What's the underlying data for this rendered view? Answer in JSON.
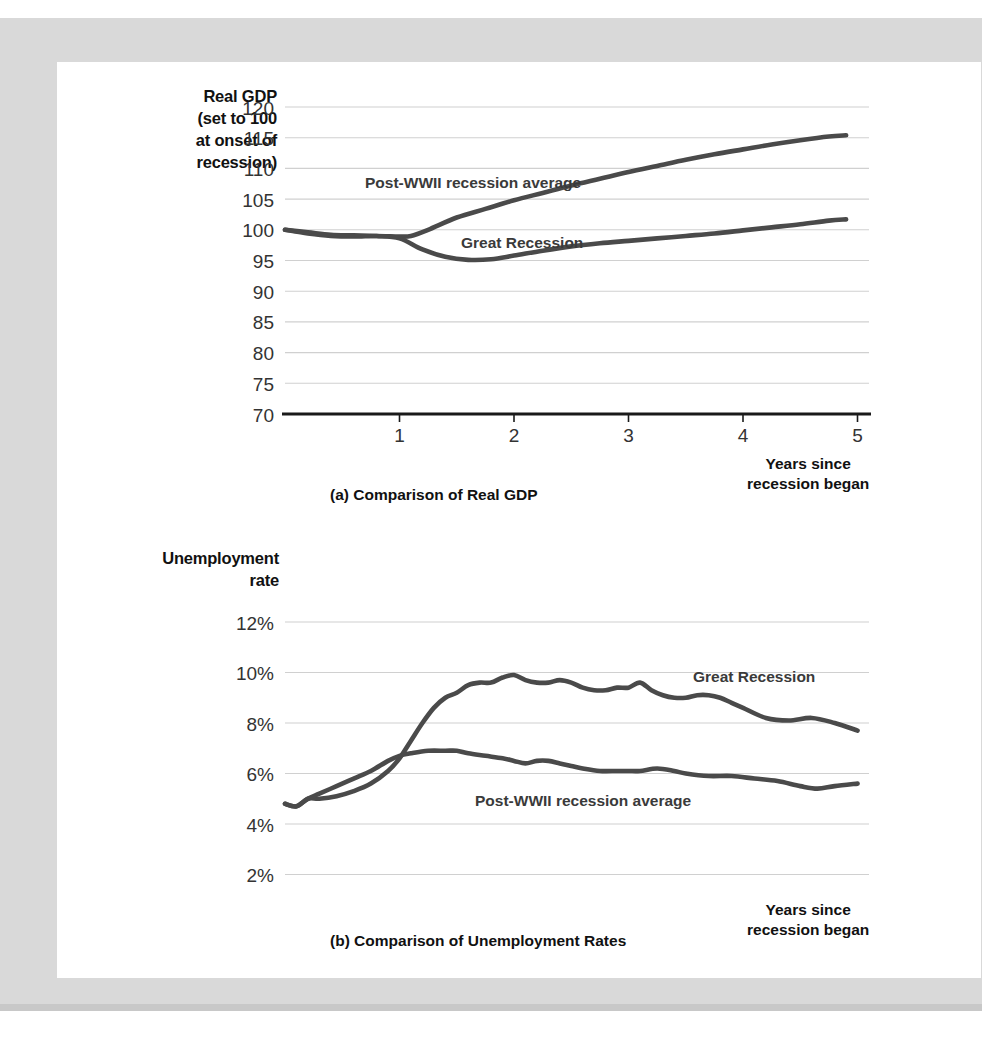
{
  "figures": [
    {
      "id": "a",
      "caption": "(a) Comparison of Real GDP",
      "axis_title": "Real GDP (set to 100 at onset of recession)",
      "axis_title_lines": [
        "Real GDP",
        "(set to 100",
        "at onset of",
        "recession)"
      ],
      "x_axis_label_lines": [
        "Years since",
        "recession began"
      ],
      "series_labels": {
        "postwwii": "Post-WWII recession average",
        "great": "Great Recession"
      }
    },
    {
      "id": "b",
      "caption": "(b) Comparison of Unemployment Rates",
      "axis_title": "Unemployment rate",
      "axis_title_lines": [
        "Unemployment",
        "rate"
      ],
      "x_axis_label_lines": [
        "Years since",
        "recession began"
      ],
      "series_labels": {
        "postwwii": "Post-WWII recession average",
        "great": "Great Recession"
      }
    }
  ],
  "colors": {
    "line": "#4a4a4a",
    "axis": "#1a1a1a",
    "grid": "#d0d0d0",
    "tick_text": "#333333",
    "mat": "#d9d9d9",
    "card": "#ffffff"
  },
  "chart_data": [
    {
      "type": "line",
      "title": "(a) Comparison of Real GDP",
      "xlabel": "Years since recession began",
      "ylabel": "Real GDP (set to 100 at onset of recession)",
      "xlim": [
        0,
        5.1
      ],
      "ylim": [
        70,
        120
      ],
      "xticks": [
        1,
        2,
        3,
        4,
        5
      ],
      "xtick_labels": [
        "1",
        "2",
        "3",
        "4",
        "5"
      ],
      "yticks": [
        70,
        75,
        80,
        85,
        90,
        95,
        100,
        105,
        110,
        115,
        120
      ],
      "ytick_labels": [
        "70",
        "75",
        "80",
        "85",
        "90",
        "95",
        "100",
        "105",
        "110",
        "115",
        "120"
      ],
      "grid": true,
      "legend": "inline-annotation",
      "series": [
        {
          "name": "Post-WWII recession average",
          "x": [
            0,
            0.2,
            0.4,
            0.6,
            0.8,
            1.0,
            1.1,
            1.25,
            1.5,
            1.75,
            2.0,
            2.25,
            2.5,
            2.75,
            3.0,
            3.25,
            3.5,
            3.75,
            4.0,
            4.25,
            4.5,
            4.75,
            4.9
          ],
          "values": [
            100.0,
            99.4,
            99.0,
            98.9,
            99.0,
            98.9,
            99.0,
            100.0,
            102.0,
            103.4,
            104.8,
            106.0,
            107.2,
            108.3,
            109.4,
            110.4,
            111.4,
            112.3,
            113.1,
            113.9,
            114.6,
            115.2,
            115.4
          ]
        },
        {
          "name": "Great Recession",
          "x": [
            0,
            0.2,
            0.4,
            0.6,
            0.8,
            1.0,
            1.2,
            1.4,
            1.6,
            1.8,
            2.0,
            2.25,
            2.5,
            2.75,
            3.0,
            3.25,
            3.5,
            3.75,
            4.0,
            4.25,
            4.5,
            4.75,
            4.9
          ],
          "values": [
            100.0,
            99.6,
            99.2,
            99.1,
            99.0,
            98.6,
            96.8,
            95.6,
            95.1,
            95.2,
            95.8,
            96.6,
            97.3,
            97.8,
            98.2,
            98.6,
            99.0,
            99.4,
            99.9,
            100.4,
            100.9,
            101.5,
            101.7
          ]
        }
      ]
    },
    {
      "type": "line",
      "title": "(b) Comparison of Unemployment Rates",
      "xlabel": "Years since recession began",
      "ylabel": "Unemployment rate",
      "xlim": [
        0,
        5.1
      ],
      "ylim": [
        0,
        12
      ],
      "xticks": [
        1,
        2,
        3,
        4,
        5
      ],
      "xtick_labels": [
        "1",
        "2",
        "3",
        "4",
        "5"
      ],
      "yticks": [
        0,
        2,
        4,
        6,
        8,
        10,
        12
      ],
      "ytick_labels": [
        "0%",
        "2%",
        "4%",
        "6%",
        "8%",
        "10%",
        "12%"
      ],
      "grid": true,
      "legend": "inline-annotation",
      "series": [
        {
          "name": "Great Recession",
          "x": [
            0,
            0.1,
            0.2,
            0.3,
            0.45,
            0.6,
            0.75,
            0.9,
            1.0,
            1.1,
            1.2,
            1.3,
            1.4,
            1.5,
            1.6,
            1.7,
            1.8,
            1.9,
            2.0,
            2.1,
            2.2,
            2.3,
            2.4,
            2.5,
            2.6,
            2.7,
            2.8,
            2.9,
            3.0,
            3.1,
            3.2,
            3.3,
            3.4,
            3.5,
            3.6,
            3.7,
            3.8,
            3.9,
            4.0,
            4.2,
            4.4,
            4.6,
            4.8,
            5.0
          ],
          "values": [
            4.8,
            4.7,
            5.0,
            5.0,
            5.1,
            5.3,
            5.6,
            6.1,
            6.6,
            7.3,
            8.0,
            8.6,
            9.0,
            9.2,
            9.5,
            9.6,
            9.6,
            9.8,
            9.9,
            9.7,
            9.6,
            9.6,
            9.7,
            9.6,
            9.4,
            9.3,
            9.3,
            9.4,
            9.4,
            9.6,
            9.3,
            9.1,
            9.0,
            9.0,
            9.1,
            9.1,
            9.0,
            8.8,
            8.6,
            8.2,
            8.1,
            8.2,
            8.0,
            7.7
          ]
        },
        {
          "name": "Post-WWII recession average",
          "x": [
            0,
            0.1,
            0.2,
            0.3,
            0.45,
            0.6,
            0.75,
            0.9,
            1.0,
            1.1,
            1.25,
            1.4,
            1.5,
            1.6,
            1.75,
            1.9,
            2.0,
            2.1,
            2.2,
            2.3,
            2.4,
            2.5,
            2.6,
            2.75,
            2.9,
            3.0,
            3.1,
            3.25,
            3.4,
            3.5,
            3.7,
            3.9,
            4.1,
            4.3,
            4.5,
            4.65,
            4.8,
            5.0
          ],
          "values": [
            4.8,
            4.7,
            5.0,
            5.2,
            5.5,
            5.8,
            6.1,
            6.5,
            6.7,
            6.8,
            6.9,
            6.9,
            6.9,
            6.8,
            6.7,
            6.6,
            6.5,
            6.4,
            6.5,
            6.5,
            6.4,
            6.3,
            6.2,
            6.1,
            6.1,
            6.1,
            6.1,
            6.2,
            6.1,
            6.0,
            5.9,
            5.9,
            5.8,
            5.7,
            5.5,
            5.4,
            5.5,
            5.6
          ]
        }
      ]
    }
  ]
}
